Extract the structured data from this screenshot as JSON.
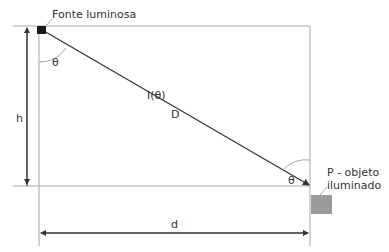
{
  "diagram": {
    "source_label": "Fonte luminosa",
    "object_label_line1": "P - objeto",
    "object_label_line2": "iluminado",
    "height_label": "h",
    "distance_label": "d",
    "angle_label_top": "θ",
    "angle_label_bottom": "θ",
    "intensity_label": "I(θ)",
    "ray_distance_label": "D",
    "colors": {
      "frame": "#9a9a9a",
      "ray": "#333333",
      "source": "#1a1a1a",
      "object": "#9b9b9b"
    }
  }
}
